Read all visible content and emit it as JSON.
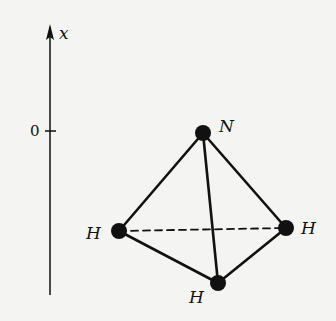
{
  "axis": {
    "label": "x",
    "tick_label": "0"
  },
  "molecule": {
    "name": "NH3 tetrahedral geometry",
    "atoms": [
      {
        "id": "N",
        "label": "N",
        "x": 203,
        "y": 133
      },
      {
        "id": "H1",
        "label": "H",
        "x": 119,
        "y": 231
      },
      {
        "id": "H2",
        "label": "H",
        "x": 286,
        "y": 228
      },
      {
        "id": "H3",
        "label": "H",
        "x": 218,
        "y": 283
      }
    ],
    "bonds_solid": [
      [
        "N",
        "H1"
      ],
      [
        "N",
        "H2"
      ],
      [
        "N",
        "H3"
      ],
      [
        "H1",
        "H3"
      ],
      [
        "H3",
        "H2"
      ]
    ],
    "bonds_dashed": [
      [
        "H1",
        "H2"
      ]
    ]
  },
  "colors": {
    "ink": "#111111",
    "background": "#f4f4f2"
  }
}
